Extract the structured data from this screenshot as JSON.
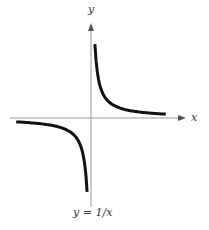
{
  "chart_data": {
    "type": "line",
    "title": "",
    "caption": "y = 1/x",
    "xlabel": "x",
    "ylabel": "y",
    "function": "y = 1/x",
    "grid": false,
    "legend": null,
    "series": [
      {
        "name": "y = 1/x (x>0)",
        "x": [
          0.23,
          0.5,
          1,
          2,
          3,
          4.4
        ],
        "y": [
          4.35,
          2,
          1,
          0.5,
          0.33,
          0.23
        ]
      },
      {
        "name": "y = 1/x (x<0)",
        "x": [
          -4.4,
          -3,
          -2,
          -1,
          -0.5,
          -0.23
        ],
        "y": [
          -0.23,
          -0.33,
          -0.5,
          -1,
          -2,
          -4.35
        ]
      }
    ],
    "xlim": [
      -4.7,
      5.5
    ],
    "ylim": [
      -5.1,
      6.4
    ]
  },
  "labels": {
    "x_axis": "x",
    "y_axis": "y",
    "caption": "y = 1/x"
  }
}
